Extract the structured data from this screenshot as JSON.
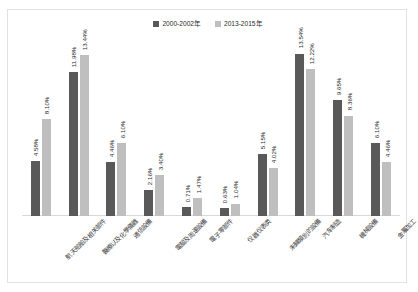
{
  "chart_data": {
    "type": "bar",
    "title": "",
    "subtitle": "",
    "xlabel": "",
    "ylabel": "",
    "grid": false,
    "legend_position": "top-center",
    "ylim": [
      0,
      15
    ],
    "value_suffix": "%",
    "categories": [
      "航天船舶及相关部件",
      "醫療以及化學儀器",
      "通信設備",
      "電腦及周邊設備",
      "電子零部件",
      "仪器仪表类",
      "未歸類別的設備",
      "汽车制造",
      "機械設備",
      "金屬加工"
    ],
    "series": [
      {
        "name": "2000-2002年",
        "color": "#595959",
        "values": [
          4.58,
          11.98,
          4.46,
          2.16,
          0.71,
          0.63,
          5.15,
          13.54,
          9.65,
          6.1
        ],
        "labels": [
          "4.58%",
          "11.98%",
          "4.46%",
          "2.16%",
          "0.71%",
          "0.63%",
          "5.15%",
          "13.54%",
          "9.65%",
          "6.10%"
        ]
      },
      {
        "name": "2013-2015年",
        "color": "#bfbfbf",
        "values": [
          8.1,
          13.44,
          6.1,
          3.4,
          1.47,
          1.04,
          4.02,
          12.22,
          8.36,
          4.46
        ],
        "labels": [
          "8.10%",
          "13.44%",
          "6.10%",
          "3.40%",
          "1.47%",
          "1.04%",
          "4.02%",
          "12.22%",
          "8.36%",
          "4.46%"
        ]
      }
    ]
  },
  "legend": {
    "entries": [
      {
        "label": "2000-2002年",
        "color": "#595959"
      },
      {
        "label": "2013-2015年",
        "color": "#bfbfbf"
      }
    ]
  },
  "colors": {
    "series_a": "#595959",
    "series_b": "#bfbfbf",
    "frame": "#e2e2e2",
    "axis": "#d9d9d9",
    "text": "#2d2d2d",
    "background": "#ffffff"
  }
}
